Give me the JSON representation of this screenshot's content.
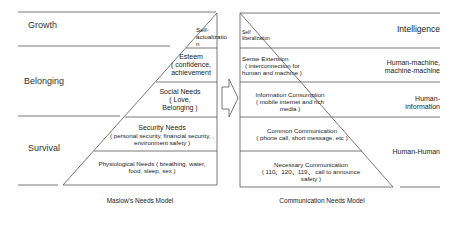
{
  "left_model": {
    "caption": "Maslow's Needs Model",
    "bands": [
      {
        "label": "Growth"
      },
      {
        "label": "Belonging"
      },
      {
        "label": "Survival"
      }
    ],
    "levels": [
      {
        "title": "Self-",
        "line2": "actualizatio",
        "line3": "n"
      },
      {
        "title": "Esteem",
        "line2": "( confidence,",
        "line3": "achievement"
      },
      {
        "title": "Social Needs",
        "line2": "( Love,",
        "line3": "Belonging )"
      },
      {
        "title": "Security Needs",
        "line2": "( personal security, financial security, ,",
        "line3": "environment safety )"
      },
      {
        "title": "Physiological Needs ( breathing, water,",
        "line2": "food, sleep, sex )"
      }
    ]
  },
  "right_model": {
    "caption": "Communication Needs Model",
    "bands": [
      {
        "label": "Intelligence"
      },
      {
        "label": "Human-machine,",
        "line2": "machine-machine"
      },
      {
        "label": "Human-",
        "line2": "information"
      },
      {
        "label": "Human-Human"
      }
    ],
    "levels": [
      {
        "title": "Self",
        "line2": "liberalization"
      },
      {
        "title": "Sense Extension",
        "line2": "( interconnection for",
        "line3": "human and machine )"
      },
      {
        "title": "Information Consumption",
        "line2": "( mobile internet and rich",
        "line3": "media )"
      },
      {
        "title": "Common Communication",
        "line2": "( phone call, short message, etc )"
      },
      {
        "title": "Necessary Communication",
        "line2": "( 110、120、119、 call to announce",
        "line3": "safety )"
      }
    ]
  },
  "arrow": {
    "direction": "right",
    "icon": "hollow-arrow-right-icon"
  },
  "colors": {
    "line": "#555555",
    "text": "#222222",
    "background": "#ffffff"
  }
}
